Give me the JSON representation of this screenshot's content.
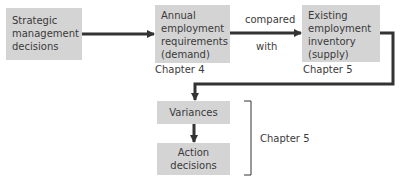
{
  "boxes": {
    "strategic": {
      "text": "Strategic\nmanagement\ndecisions"
    },
    "demand": {
      "text": "Annual\nemployment\nrequirements\n(demand)",
      "chapter": "Chapter 4"
    },
    "supply": {
      "text": "Existing\nemployment\ninventory\n(supply)",
      "chapter": "Chapter 5"
    },
    "variances": {
      "text": "Variances"
    },
    "action": {
      "text": "Action\ndecisions"
    }
  },
  "connector_labels": {
    "above": "compared",
    "below": "with"
  },
  "bracket_label": "Chapter 5",
  "colors": {
    "box_fill": "#d4d4d4",
    "line": "#333333",
    "text": "#3a3a3a"
  }
}
